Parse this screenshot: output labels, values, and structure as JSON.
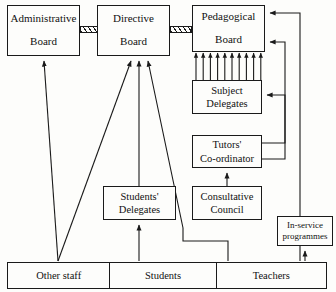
{
  "diagram": {
    "type": "organisational-flow-diagram",
    "stroke_color": "#1a1a1a",
    "background_color": "#fdfdfb",
    "nodes": [
      {
        "id": "administrative-board",
        "line1": "Administrative",
        "line2": "Board",
        "x": 7,
        "y": 5,
        "w": 73,
        "h": 51
      },
      {
        "id": "directive-board",
        "line1": "Directive",
        "line2": "Board",
        "x": 97,
        "y": 5,
        "w": 73,
        "h": 51
      },
      {
        "id": "pedagogical-board",
        "line1": "Pedagogical",
        "line2": "Board",
        "x": 192,
        "y": 5,
        "w": 73,
        "h": 47
      },
      {
        "id": "subject-delegates",
        "line1": "Subject",
        "line2": "Delegates",
        "x": 192,
        "y": 80,
        "w": 70,
        "h": 34
      },
      {
        "id": "tutors-coordinator",
        "line1": "Tutors'",
        "line2": "Co-ordinator",
        "x": 192,
        "y": 135,
        "w": 70,
        "h": 33
      },
      {
        "id": "consultative-council",
        "line1": "Consultative",
        "line2": "Council",
        "x": 192,
        "y": 186,
        "w": 70,
        "h": 34
      },
      {
        "id": "students-delegates",
        "line1": "Students'",
        "line2": "Delegates",
        "x": 103,
        "y": 186,
        "w": 73,
        "h": 34
      },
      {
        "id": "in-service-programmes",
        "line1": "In-service",
        "line2": "programmes",
        "x": 277,
        "y": 216,
        "w": 56,
        "h": 30
      }
    ],
    "base_bar": {
      "id": "constituency-bar",
      "cells": [
        {
          "id": "other-staff",
          "label": "Other staff",
          "width": 103
        },
        {
          "id": "students",
          "label": "Students",
          "width": 107
        },
        {
          "id": "teachers",
          "label": "Teachers",
          "width": 110
        }
      ]
    },
    "hatched_links": [
      {
        "id": "admin-directive-link",
        "x": 80,
        "y": 26,
        "w": 18,
        "h": 7
      },
      {
        "id": "directive-pedagogical-link",
        "x": 170,
        "y": 26,
        "w": 22,
        "h": 7
      }
    ],
    "comb_arrows": {
      "id": "subject-delegates-to-pedagogical-board",
      "count": 10,
      "from_y": 80,
      "to_y": 53,
      "x_start": 196,
      "x_step": 7.2
    },
    "edges": [
      {
        "id": "other-staff-to-administrative-board",
        "kind": "diagonal-arrow"
      },
      {
        "id": "other-staff-to-directive-board",
        "kind": "diagonal-arrow"
      },
      {
        "id": "students-to-students-delegates",
        "kind": "vertical-arrow"
      },
      {
        "id": "students-delegates-to-directive-board",
        "kind": "vertical-arrow"
      },
      {
        "id": "teachers-to-directive-board",
        "kind": "routed-diagonal-arrow"
      },
      {
        "id": "teachers-to-pedagogical-board",
        "kind": "routed-orthogonal-arrow"
      },
      {
        "id": "teachers-to-in-service-programmes",
        "kind": "vertical-arrow"
      },
      {
        "id": "consultative-council-to-tutors-coordinator",
        "kind": "vertical-arrow"
      },
      {
        "id": "tutors-coordinator-to-subject-delegates",
        "kind": "routed-orthogonal-arrow"
      },
      {
        "id": "tutors-coordinator-to-pedagogical-board",
        "kind": "routed-orthogonal-arrow"
      }
    ]
  }
}
